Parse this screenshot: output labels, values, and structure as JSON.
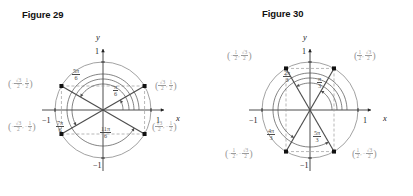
{
  "page": {
    "background": "#ffffff",
    "width": 413,
    "height": 196
  },
  "figures": [
    {
      "id": "figure-29",
      "title": "Figure 29",
      "axes": {
        "x_name": "x",
        "y_name": "y",
        "x_pos_tick": "1",
        "x_neg_tick": "−1",
        "y_pos_tick": "1",
        "y_neg_tick": "−1"
      },
      "circle": {
        "radius_label": "1",
        "color": "#6b6b6b"
      },
      "angles": [
        {
          "name": "pi-over-6",
          "num": "π",
          "den": "6",
          "value_rad": 0.5236
        },
        {
          "name": "5pi-over-6",
          "num": "5π",
          "den": "6",
          "value_rad": 2.618
        },
        {
          "name": "7pi-over-6",
          "num": "7π",
          "den": "6",
          "value_rad": 3.665
        },
        {
          "name": "11pi-over-6",
          "num": "11π",
          "den": "6",
          "value_rad": 5.7596
        }
      ],
      "points": [
        {
          "name": "point-q1",
          "x_num": "√3",
          "x_den": "2",
          "x_sign": "",
          "y_num": "1",
          "y_den": "2",
          "y_sign": "",
          "px": 0.866,
          "py": 0.5
        },
        {
          "name": "point-q2",
          "x_num": "√3",
          "x_den": "2",
          "x_sign": "−",
          "y_num": "1",
          "y_den": "2",
          "y_sign": "",
          "px": -0.866,
          "py": 0.5
        },
        {
          "name": "point-q3",
          "x_num": "√3",
          "x_den": "2",
          "x_sign": "−",
          "y_num": "1",
          "y_den": "2",
          "y_sign": "−",
          "px": -0.866,
          "py": -0.5
        },
        {
          "name": "point-q4",
          "x_num": "√3",
          "x_den": "2",
          "x_sign": "",
          "y_num": "1",
          "y_den": "2",
          "y_sign": "−",
          "px": 0.866,
          "py": -0.5
        }
      ]
    },
    {
      "id": "figure-30",
      "title": "Figure 30",
      "axes": {
        "x_name": "x",
        "y_name": "y",
        "x_pos_tick": "1",
        "x_neg_tick": "−1",
        "y_pos_tick": "1",
        "y_neg_tick": "−1"
      },
      "circle": {
        "radius_label": "1",
        "color": "#6b6b6b"
      },
      "angles": [
        {
          "name": "pi-over-3",
          "num": "π",
          "den": "3",
          "value_rad": 1.0472
        },
        {
          "name": "2pi-over-3",
          "num": "2π",
          "den": "3",
          "value_rad": 2.0944
        },
        {
          "name": "4pi-over-3",
          "num": "4π",
          "den": "3",
          "value_rad": 4.1888
        },
        {
          "name": "5pi-over-3",
          "num": "5π",
          "den": "3",
          "value_rad": 5.236
        }
      ],
      "points": [
        {
          "name": "point-q1",
          "x_num": "1",
          "x_den": "2",
          "x_sign": "",
          "y_num": "√3",
          "y_den": "2",
          "y_sign": "",
          "px": 0.5,
          "py": 0.866
        },
        {
          "name": "point-q2",
          "x_num": "1",
          "x_den": "2",
          "x_sign": "−",
          "y_num": "√3",
          "y_den": "2",
          "y_sign": "",
          "px": -0.5,
          "py": 0.866
        },
        {
          "name": "point-q3",
          "x_num": "1",
          "x_den": "2",
          "x_sign": "−",
          "y_num": "√3",
          "y_den": "2",
          "y_sign": "−",
          "px": -0.5,
          "py": -0.866
        },
        {
          "name": "point-q4",
          "x_num": "1",
          "x_den": "2",
          "x_sign": "",
          "y_num": "√3",
          "y_den": "2",
          "y_sign": "−",
          "px": 0.5,
          "py": -0.866
        }
      ]
    }
  ],
  "chart_data": {
    "type": "scatter",
    "xlabel": "x",
    "ylabel": "y",
    "xlim": [
      -1.15,
      1.15
    ],
    "ylim": [
      -1.15,
      1.15
    ],
    "grid": false,
    "legend": "none",
    "panels": [
      {
        "title": "Figure 29",
        "angles_rad": [
          0.5236,
          2.618,
          3.665,
          5.7596
        ],
        "angle_labels": [
          "π/6",
          "5π/6",
          "7π/6",
          "11π/6"
        ],
        "x": [
          0.866,
          -0.866,
          -0.866,
          0.866
        ],
        "y": [
          0.5,
          0.5,
          -0.5,
          -0.5
        ],
        "point_labels": [
          "(√3/2, 1/2)",
          "(−√3/2, 1/2)",
          "(−√3/2, −1/2)",
          "(√3/2, −1/2)"
        ]
      },
      {
        "title": "Figure 30",
        "angles_rad": [
          1.0472,
          2.0944,
          4.1888,
          5.236
        ],
        "angle_labels": [
          "π/3",
          "2π/3",
          "4π/3",
          "5π/3"
        ],
        "x": [
          0.5,
          -0.5,
          -0.5,
          0.5
        ],
        "y": [
          0.866,
          0.866,
          -0.866,
          -0.866
        ],
        "point_labels": [
          "(1/2, √3/2)",
          "(−1/2, √3/2)",
          "(−1/2, −√3/2)",
          "(1/2, −√3/2)"
        ]
      }
    ]
  }
}
